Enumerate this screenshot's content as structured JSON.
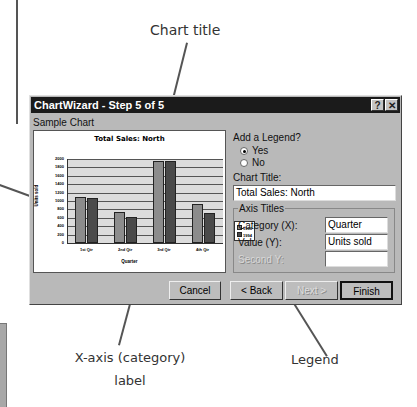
{
  "callouts": {
    "chart_title": "Chart title",
    "x_axis_line1": "X-axis (category)",
    "x_axis_line2": "label",
    "legend": "Legend"
  },
  "dialog": {
    "title": "ChartWizard - Step 5 of 5",
    "help_button": "?",
    "close_button": "✕",
    "sample_chart_label": "Sample Chart",
    "add_legend_label": "Add a Legend?",
    "legend_options": [
      {
        "label": "Yes",
        "selected": true
      },
      {
        "label": "No",
        "selected": false
      }
    ],
    "chart_title_label": "Chart Title:",
    "chart_title_value": "Total Sales: North",
    "axis_titles_label": "Axis Titles",
    "category_label": "Category (X):",
    "category_value": "Quarter",
    "value_label": "Value (Y):",
    "value_value": "Units sold",
    "second_y_label": "Second Y:",
    "second_y_value": "",
    "buttons": {
      "cancel": "Cancel",
      "back": "< Back",
      "next": "Next >",
      "finish": "Finish"
    }
  },
  "chart_data": {
    "type": "bar",
    "title": "Total Sales: North",
    "xlabel": "Quarter",
    "ylabel": "Units sold",
    "categories": [
      "1st Qtr",
      "2nd Qtr",
      "3rd Qtr",
      "4th Qtr"
    ],
    "series": [
      {
        "name": "1993",
        "color": "#8c8c8c",
        "values": [
          1100,
          730,
          1960,
          920
        ]
      },
      {
        "name": "1994",
        "color": "#4a4a4a",
        "values": [
          1060,
          620,
          1960,
          710
        ]
      }
    ],
    "yticks": [
      "2000",
      "1800",
      "1600",
      "1400",
      "1200",
      "1000",
      "800",
      "600",
      "400",
      "200",
      "0"
    ],
    "ylim": [
      0,
      2000
    ],
    "grid": true,
    "legend_position": "right"
  }
}
